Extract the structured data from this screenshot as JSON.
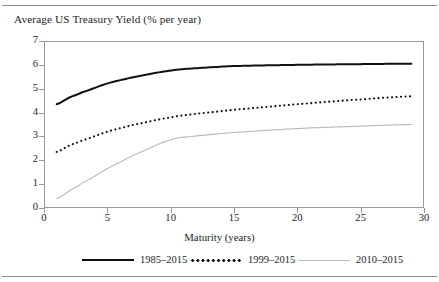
{
  "chart_data": {
    "type": "line",
    "title": "Average US Treasury Yield (% per year)",
    "xlabel": "Maturity (years)",
    "ylabel": "",
    "xlim": [
      0,
      30
    ],
    "ylim": [
      0,
      7
    ],
    "xticks": [
      0,
      5,
      10,
      15,
      20,
      25,
      30
    ],
    "yticks": [
      0,
      1,
      2,
      3,
      4,
      5,
      6,
      7
    ],
    "grid": false,
    "legend_position": "bottom",
    "x": [
      1,
      2,
      3,
      5,
      7,
      10,
      12,
      15,
      20,
      25,
      29
    ],
    "series": [
      {
        "name": "1985–2015",
        "style": "solid",
        "color": "#111111",
        "values": [
          4.35,
          4.63,
          4.85,
          5.22,
          5.48,
          5.76,
          5.86,
          5.95,
          6.0,
          6.03,
          6.05
        ]
      },
      {
        "name": "1999–2015",
        "style": "dotted",
        "color": "#111111",
        "values": [
          2.35,
          2.62,
          2.83,
          3.2,
          3.48,
          3.8,
          3.95,
          4.12,
          4.35,
          4.55,
          4.68
        ]
      },
      {
        "name": "2010–2015",
        "style": "thin-light",
        "color": "#b9b9b9",
        "values": [
          0.4,
          0.72,
          1.05,
          1.65,
          2.2,
          2.85,
          3.02,
          3.17,
          3.33,
          3.43,
          3.5
        ]
      }
    ]
  },
  "axis": {
    "y_tick_labels": [
      "7",
      "6",
      "5",
      "4",
      "3",
      "2",
      "1",
      "0"
    ],
    "x_tick_labels": [
      "0",
      "5",
      "10",
      "15",
      "20",
      "25",
      "30"
    ],
    "x_axis_title": "Maturity (years)"
  },
  "legend": {
    "items": [
      {
        "label": "1985–2015",
        "style": "solid"
      },
      {
        "label": "1999–2015",
        "style": "dotted"
      },
      {
        "label": "2010–2015",
        "style": "thin-light"
      }
    ]
  },
  "colors": {
    "series_1": "#111111",
    "series_2": "#111111",
    "series_3": "#b9b9b9",
    "frame": "#9a9a9a",
    "text": "#1d1d1d",
    "rule": "#8d8d8d"
  }
}
